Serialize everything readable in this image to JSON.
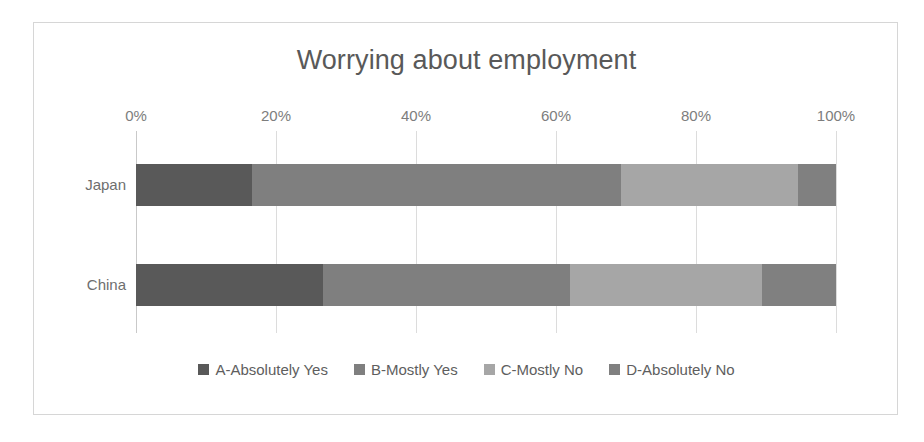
{
  "chart_data": {
    "type": "bar",
    "orientation": "horizontal",
    "stacked": true,
    "stack_mode": "percent",
    "title": "Worrying about employment",
    "xlabel": "",
    "ylabel": "",
    "xlim": [
      0,
      100
    ],
    "xticks": [
      0,
      20,
      40,
      60,
      80,
      100
    ],
    "xtick_labels": [
      "0%",
      "20%",
      "40%",
      "60%",
      "80%",
      "100%"
    ],
    "grid": true,
    "grid_axis": "x",
    "legend_position": "bottom",
    "categories": [
      "Japan",
      "China"
    ],
    "series": [
      {
        "name": "A-Absolutely Yes",
        "color": "#595959",
        "values": [
          16.5,
          26.7
        ]
      },
      {
        "name": "B-Mostly Yes",
        "color": "#7f7f7f",
        "values": [
          52.8,
          35.3
        ]
      },
      {
        "name": "C-Mostly No",
        "color": "#a6a6a6",
        "values": [
          25.3,
          27.4
        ]
      },
      {
        "name": "D-Absolutely No",
        "color": "#808080",
        "values": [
          5.4,
          10.6
        ]
      }
    ]
  },
  "frame": {
    "border_color": "#d6d6d6",
    "background": "#ffffff"
  }
}
